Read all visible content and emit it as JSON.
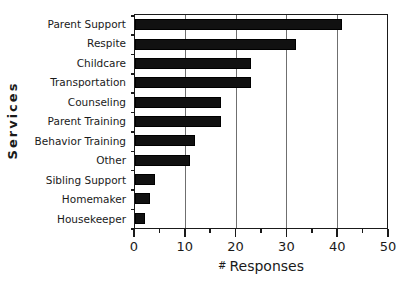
{
  "chart_data": {
    "type": "bar",
    "orientation": "horizontal",
    "title": "",
    "xlabel": "# Responses",
    "ylabel": "Services",
    "categories": [
      "Parent Support",
      "Respite",
      "Childcare",
      "Transportation",
      "Counseling",
      "Parent Training",
      "Behavior Training",
      "Other",
      "Sibling Support",
      "Homemaker",
      "Housekeeper"
    ],
    "values": [
      41,
      32,
      23,
      23,
      17,
      17,
      12,
      11,
      4,
      3,
      2
    ],
    "xlim": [
      0,
      50
    ],
    "xticks": [
      0,
      10,
      20,
      30,
      40,
      50
    ],
    "xticklabels": [
      "0",
      "10",
      "20",
      "30",
      "40",
      "50"
    ],
    "xminorticks": [
      5,
      15,
      25,
      35,
      45
    ],
    "grid": "vertical-major",
    "legend": "none",
    "bar_color": "#111111",
    "axis_color": "#1a1a1a",
    "grid_color": "#6f6f6f",
    "background": "#ffffff"
  },
  "xlabel_parts": {
    "hash": "#",
    "text": "Responses"
  }
}
